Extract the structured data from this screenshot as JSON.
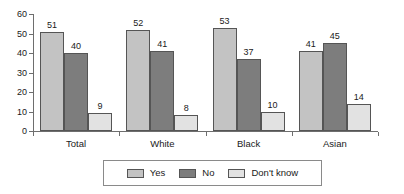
{
  "chart_data": {
    "type": "bar",
    "title": "",
    "subtitle": "",
    "xlabel": "",
    "ylabel": "",
    "categories": [
      "Total",
      "White",
      "Black",
      "Asian"
    ],
    "series": [
      {
        "name": "Yes",
        "values": [
          51,
          52,
          53,
          41
        ],
        "color": "#c3c3c3"
      },
      {
        "name": "No",
        "values": [
          40,
          41,
          37,
          45
        ],
        "color": "#7d7d7d"
      },
      {
        "name": "Don't know",
        "values": [
          9,
          8,
          10,
          14
        ],
        "color": "#e2e2e2"
      }
    ],
    "ylim": [
      0,
      60
    ],
    "yticks": [
      0,
      10,
      20,
      30,
      40,
      50,
      60
    ],
    "ytick_labels": [
      "0",
      "10",
      "20",
      "30",
      "40",
      "50",
      "60"
    ],
    "grid": false,
    "legend_position": "bottom",
    "show_value_labels": true,
    "axis_color": "#6e6e6e",
    "text_color": "#1a1a1a",
    "background": "#ffffff"
  }
}
